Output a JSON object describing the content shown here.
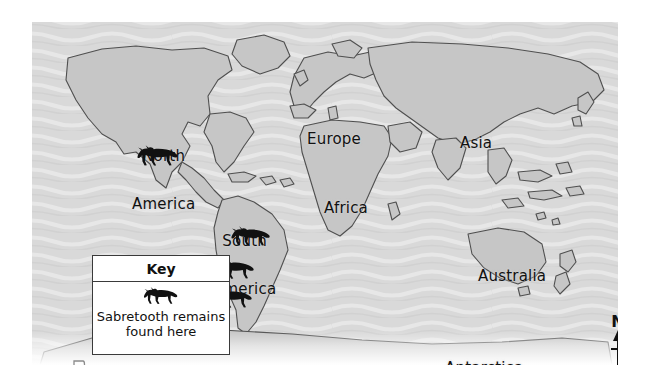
{
  "map": {
    "title": "World map showing sabretooth remains locations",
    "ocean_color": "#d9d9d9",
    "land_color": "#c6c6c6",
    "land_outline_color": "#4a4a4a",
    "marker_color": "#111111",
    "continent_labels": [
      {
        "id": "north-america",
        "line1": "North",
        "line2": "America"
      },
      {
        "id": "south-america",
        "line1": "South",
        "line2": "America"
      },
      {
        "id": "europe",
        "line1": "Europe"
      },
      {
        "id": "africa",
        "line1": "Africa"
      },
      {
        "id": "asia",
        "line1": "Asia"
      },
      {
        "id": "australia",
        "line1": "Australia"
      },
      {
        "id": "antarctica",
        "line1": "Antarctica"
      }
    ],
    "markers": [
      {
        "id": "marker-north-america",
        "icon": "sabretooth-icon",
        "region": "North America"
      },
      {
        "id": "marker-south-america-north",
        "icon": "sabretooth-icon",
        "region": "South America"
      },
      {
        "id": "marker-south-america-middle",
        "icon": "sabretooth-icon",
        "region": "South America"
      },
      {
        "id": "marker-south-america-south",
        "icon": "sabretooth-icon",
        "region": "South America"
      }
    ]
  },
  "key": {
    "title": "Key",
    "symbol_icon": "sabretooth-icon",
    "symbol_label_line1": "Sabretooth remains",
    "symbol_label_line2": "found here"
  },
  "compass": {
    "north_label": "N",
    "icon": "north-arrow-icon"
  },
  "corner": {
    "icon": "pennant-flag-icon"
  }
}
